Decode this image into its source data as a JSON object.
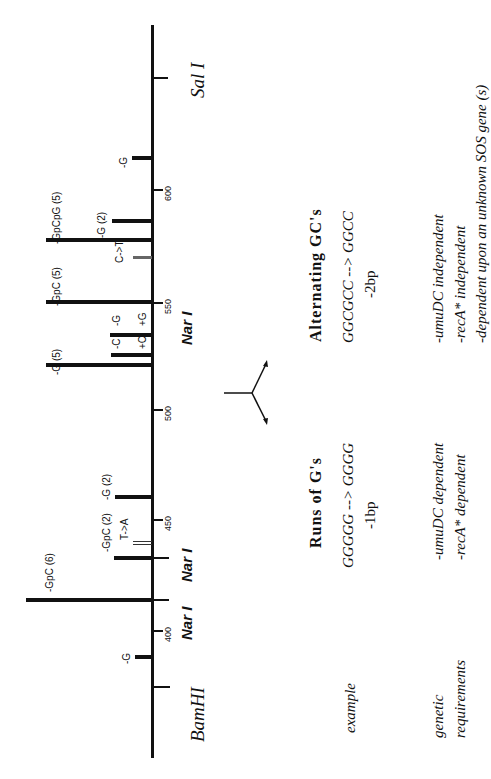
{
  "figure": {
    "axis": {
      "orientation": "vertical-rotated",
      "ticks": [
        {
          "label": "600",
          "y": 190
        },
        {
          "label": "550",
          "y": 303
        },
        {
          "label": "500",
          "y": 410
        },
        {
          "label": "450",
          "y": 520
        },
        {
          "label": "400",
          "y": 631
        }
      ]
    },
    "restriction_sites": [
      {
        "label": "Sal I",
        "y": 78,
        "style": "serif"
      },
      {
        "label": "Nar I",
        "y": 303,
        "style": "sans"
      },
      {
        "label": "Nar I",
        "y": 558,
        "style": "sans"
      },
      {
        "label": "Nar I",
        "y": 600,
        "style": "sans"
      },
      {
        "label": "BamHI",
        "y": 687,
        "style": "serif"
      }
    ],
    "mutations": [
      {
        "label": "-G",
        "y": 158,
        "x_start": 132,
        "kind": "bar"
      },
      {
        "label": "-G (2)",
        "y": 221,
        "x_start": 112,
        "kind": "bar"
      },
      {
        "label": "-GpCpG (5)",
        "y": 240,
        "x_start": 46,
        "kind": "bar"
      },
      {
        "label": "C->T",
        "y": 257,
        "x_start": 133,
        "kind": "substitution"
      },
      {
        "label": "-GpC (5)",
        "y": 302,
        "x_start": 46,
        "kind": "bar"
      },
      {
        "label": "-G",
        "label2": "+G",
        "y": 335,
        "x_start": 110,
        "kind": "bar"
      },
      {
        "label": "-C",
        "label2": "+C",
        "y": 355,
        "x_start": 111,
        "kind": "bar"
      },
      {
        "label": "-G (5)",
        "y": 365,
        "x_start": 46,
        "kind": "bar"
      },
      {
        "label": "-G (2)",
        "y": 497,
        "x_start": 115,
        "kind": "bar"
      },
      {
        "label": "T->A",
        "y": 543,
        "x_start": 133,
        "kind": "substitution"
      },
      {
        "label": "-GpC (2)",
        "y": 558,
        "x_start": 114,
        "kind": "bar"
      },
      {
        "label": "-GpC (6)",
        "y": 600,
        "x_start": 26,
        "kind": "bar"
      },
      {
        "label": "-G",
        "y": 657,
        "x_start": 135,
        "kind": "bar"
      }
    ]
  },
  "table": {
    "row_labels": {
      "example": "example",
      "genetic_1": "genetic",
      "genetic_2": "requirements"
    },
    "runs_of_g": {
      "header": "Runs of G's",
      "example_line1": "GGGGG --> GGGG",
      "example_line2": "-1bp",
      "req_line1": "-umuDC dependent",
      "req_line2": "-recA* dependent"
    },
    "alternating_gc": {
      "header": "Alternating GC's",
      "example_line1": "GGCGCC --> GGCC",
      "example_line2": "-2bp",
      "req_line1": "-umuDC  independent",
      "req_line2": "-recA*  independent",
      "req_line3": "-dependent upon an unknown SOS gene (s)"
    }
  }
}
